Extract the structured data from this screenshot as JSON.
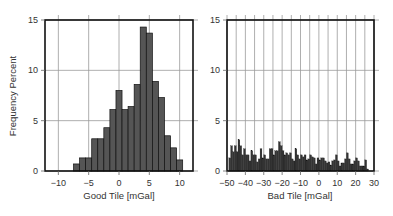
{
  "chart_data": [
    {
      "type": "bar",
      "title": "",
      "xlabel": "Good Tile [mGal]",
      "ylabel": "Frequency Percent",
      "xlim": [
        -12.2,
        12.2
      ],
      "ylim": [
        0,
        15
      ],
      "xticks": [
        -10,
        -5,
        0,
        5,
        10
      ],
      "xtick_labels": [
        "−10",
        "−5",
        "0",
        "5",
        "10"
      ],
      "yticks": [
        0,
        5,
        10,
        15
      ],
      "ytick_labels": [
        "0",
        "5",
        "10",
        "15"
      ],
      "grid": true,
      "bin_width": 1,
      "bin_start": -7.5,
      "values": [
        0.7,
        1.3,
        1.3,
        3.2,
        3.2,
        4.3,
        6.1,
        8.0,
        6.1,
        6.4,
        8.6,
        14.3,
        13.7,
        8.9,
        7.3,
        3.5,
        2.3,
        1.1
      ],
      "bar_color": "#555555"
    },
    {
      "type": "bar",
      "title": "",
      "xlabel": "Bad Tile [mGal]",
      "ylabel": "",
      "xlim": [
        -50,
        30
      ],
      "ylim": [
        0,
        15
      ],
      "xticks": [
        -50,
        -40,
        -30,
        -20,
        -10,
        0,
        10,
        20,
        30
      ],
      "xtick_labels": [
        "−50",
        "−40",
        "−30",
        "−20",
        "−10",
        "0",
        "10",
        "20",
        "30"
      ],
      "yticks": [
        0,
        5,
        10,
        15
      ],
      "ytick_labels": [
        "0",
        "5",
        "10",
        "15"
      ],
      "vgrid_step": 5,
      "grid": true,
      "bin_width": 1,
      "bin_start": -49,
      "values": [
        1.3,
        2.5,
        1.9,
        2.5,
        1.9,
        3.1,
        2.5,
        1.6,
        2.2,
        1.6,
        1.6,
        1.0,
        2.0,
        1.6,
        1.6,
        0.9,
        1.2,
        2.2,
        1.3,
        1.6,
        1.2,
        1.2,
        2.2,
        2.2,
        1.6,
        2.0,
        2.0,
        2.9,
        2.5,
        2.0,
        1.6,
        1.8,
        1.6,
        1.8,
        1.2,
        1.0,
        2.2,
        1.6,
        1.2,
        1.6,
        1.4,
        1.6,
        1.1,
        1.2,
        1.6,
        1.4,
        1.3,
        0.7,
        1.3,
        1.1,
        1.3,
        1.3,
        1.0,
        0.8,
        0.9,
        0.6,
        1.0,
        1.1,
        1.6,
        1.0,
        0.5,
        0.8,
        0.8,
        1.2,
        1.8,
        1.2,
        0.7,
        0.7,
        1.0,
        1.3,
        1.0,
        0.5,
        0.5,
        0.5,
        1.1,
        0.2,
        0.0
      ],
      "bar_color": "#333333"
    }
  ]
}
